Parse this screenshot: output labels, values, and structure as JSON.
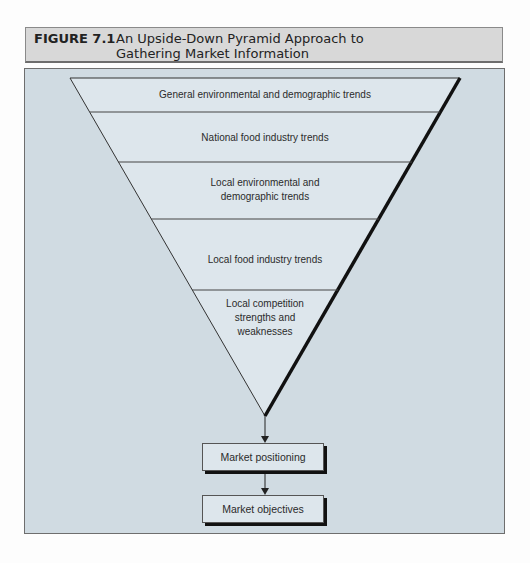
{
  "figure": {
    "label": "FIGURE 7.1",
    "title": "An Upside-Down Pyramid Approach to Gathering Market Information"
  },
  "pyramid": {
    "tiers": [
      {
        "label": "General environmental and demographic trends"
      },
      {
        "label": "National food industry trends"
      },
      {
        "label": "Local environmental and demographic trends"
      },
      {
        "label": "Local food industry trends"
      },
      {
        "label": "Local competition strengths and weaknesses"
      }
    ]
  },
  "flow": {
    "steps": [
      {
        "label": "Market positioning"
      },
      {
        "label": "Market objectives"
      }
    ]
  },
  "colors": {
    "panel_bg": "#d0dbe2",
    "pyramid_fill": "#dde6ec",
    "header_bg": "#d8d8d8",
    "line": "#333333"
  }
}
